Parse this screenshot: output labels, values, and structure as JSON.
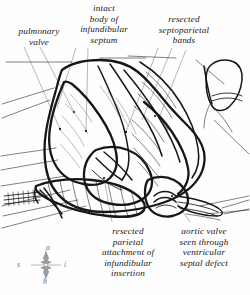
{
  "figure": {
    "kind": "surgical-anatomical-line-drawing",
    "ink_color": "#17171a",
    "leader_color": "#8a8a90",
    "background_color": "#fefefe"
  },
  "labels": [
    {
      "id": "pulmonary-valve",
      "text": "pulmonary\nvalve",
      "x": 2,
      "y": 26,
      "width": 74,
      "lines": [
        "pulmonary",
        "valve"
      ]
    },
    {
      "id": "intact-body-of-infundibular-septum",
      "text": "intact\nbody of\ninfundibular\nseptum",
      "x": 62,
      "y": 3,
      "width": 84,
      "lines": [
        "intact",
        "body of",
        "infundibular",
        "septum"
      ]
    },
    {
      "id": "resected-septoparietal-bands",
      "text": "resected\nseptoparietal\nbands",
      "x": 141,
      "y": 14,
      "width": 86,
      "lines": [
        "resected",
        "septoparietal",
        "bands"
      ]
    },
    {
      "id": "resected-parietal-attachment-of-infundibular-insertion",
      "text": "resected\nparietal\nattachment of\ninfundibular\ninsertion",
      "x": 88,
      "y": 226,
      "width": 80,
      "lines": [
        "resected",
        "parietal",
        "attachment of",
        "infundibular",
        "insertion"
      ]
    },
    {
      "id": "aortic-valve-seen-through-ventricular-septal-defect",
      "text": "aortic valve\nseen through\nventricular\nseptal defect",
      "x": 164,
      "y": 226,
      "width": 80,
      "lines": [
        "aortic valve",
        "seen through",
        "ventricular",
        "septal defect"
      ]
    }
  ],
  "compass": {
    "id": "orientation-compass",
    "top": "a",
    "right": "i",
    "bottom": "h",
    "left": "s",
    "color": "#6e6e73"
  }
}
